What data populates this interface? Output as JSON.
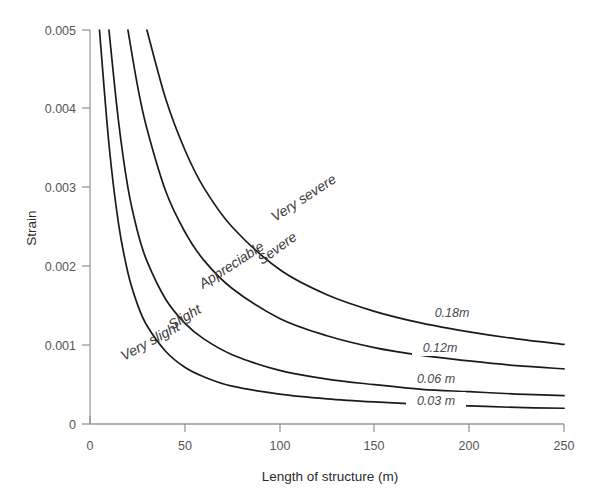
{
  "chart_data": {
    "type": "line",
    "title": "",
    "xlabel": "Length of structure  (m)",
    "ylabel": "Strain",
    "xlim": [
      0,
      250
    ],
    "ylim": [
      0,
      0.005
    ],
    "grid": false,
    "legend_position": "inline-right",
    "xticks": [
      0,
      50,
      100,
      150,
      200,
      250
    ],
    "xtick_labels": [
      "0",
      "50",
      "100",
      "150",
      "200",
      "250"
    ],
    "yticks": [
      0,
      0.001,
      0.002,
      0.003,
      0.004,
      0.005
    ],
    "ytick_labels": [
      "0",
      "0.001",
      "0.002",
      "0.003",
      "0.004",
      "0.005"
    ],
    "series": [
      {
        "name": "0.03 m",
        "label": "0.03 m",
        "x": [
          5,
          10,
          15,
          20,
          25,
          30,
          40,
          50,
          60,
          75,
          100,
          125,
          150,
          175,
          200,
          225,
          250
        ],
        "y": [
          0.005,
          0.00355,
          0.00255,
          0.00192,
          0.00152,
          0.00125,
          0.00092,
          0.00072,
          0.0006,
          0.00048,
          0.00038,
          0.00032,
          0.00028,
          0.00025,
          0.00023,
          0.00021,
          0.0002
        ]
      },
      {
        "name": "0.06 m",
        "label": "0.06 m",
        "x": [
          10,
          15,
          20,
          25,
          30,
          40,
          50,
          60,
          75,
          100,
          125,
          150,
          175,
          200,
          225,
          250
        ],
        "y": [
          0.005,
          0.00385,
          0.003,
          0.00245,
          0.00207,
          0.00158,
          0.00128,
          0.00108,
          0.00088,
          0.00068,
          0.00057,
          0.0005,
          0.00044,
          0.00041,
          0.00038,
          0.00036
        ]
      },
      {
        "name": "0.12 m",
        "label": "0.12m",
        "x": [
          20,
          25,
          30,
          40,
          50,
          60,
          75,
          100,
          125,
          150,
          175,
          200,
          225,
          250
        ],
        "y": [
          0.005,
          0.0043,
          0.00375,
          0.00295,
          0.00244,
          0.00208,
          0.00172,
          0.00134,
          0.00112,
          0.00097,
          0.00087,
          0.0008,
          0.00074,
          0.0007
        ]
      },
      {
        "name": "0.18 m",
        "label": "0.18m",
        "x": [
          30,
          40,
          50,
          60,
          75,
          100,
          125,
          150,
          175,
          200,
          225,
          250
        ],
        "y": [
          0.005,
          0.00412,
          0.00348,
          0.003,
          0.0025,
          0.00196,
          0.00164,
          0.00143,
          0.00128,
          0.00117,
          0.00108,
          0.00101
        ]
      }
    ],
    "zones": [
      {
        "name": "Very slight",
        "label": "Very slight"
      },
      {
        "name": "Slight",
        "label": "Slight"
      },
      {
        "name": "Appreciable",
        "label": "Appreciable"
      },
      {
        "name": "Severe",
        "label": "Severe"
      },
      {
        "name": "Very severe",
        "label": "Very severe"
      }
    ],
    "colors": {
      "curve": "#1b1b1b",
      "axis": "#9a9a9a",
      "text": "#3a3a3a",
      "background": "#ffffff"
    }
  }
}
